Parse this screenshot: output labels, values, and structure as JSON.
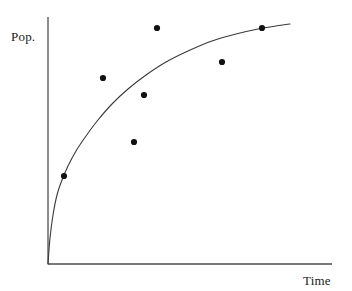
{
  "figure": {
    "background_color": "#ffffff",
    "axis_color": "#4d4d4d",
    "curve_color": "#3a3a3a",
    "point_color": "#111111",
    "width": 352,
    "height": 291
  },
  "labels": {
    "ylabel": "Pop.",
    "xlabel": "Time"
  },
  "chart_data": {
    "type": "scatter",
    "title": "",
    "subtitle": "",
    "xlabel": "Time",
    "ylabel": "Pop.",
    "grid": false,
    "legend": false,
    "legend_position": "none",
    "axis_style": "two-spine-open",
    "xlim": [
      0,
      1
    ],
    "ylim": [
      0,
      1
    ],
    "x_ticks": [],
    "y_ticks": [],
    "x_tick_labels": [],
    "y_tick_labels": [],
    "annotations": [],
    "series": [
      {
        "name": "Observations",
        "type": "scatter",
        "marker": "filled-circle",
        "marker_radius_px": 3.1,
        "color": "#111111",
        "points_px": [
          {
            "x": 64,
            "y": 176
          },
          {
            "x": 103,
            "y": 78
          },
          {
            "x": 134,
            "y": 142
          },
          {
            "x": 144,
            "y": 95
          },
          {
            "x": 157,
            "y": 28
          },
          {
            "x": 222,
            "y": 62
          },
          {
            "x": 262,
            "y": 28
          }
        ],
        "x": [
          0.056,
          0.194,
          0.303,
          0.338,
          0.384,
          0.613,
          0.754
        ],
        "y": [
          0.356,
          0.753,
          0.494,
          0.684,
          0.955,
          0.817,
          0.955
        ]
      }
    ],
    "fit_curve": {
      "name": "Fitted growth curve",
      "type": "line",
      "color": "#3a3a3a",
      "width_px": 1.1,
      "shape": "asymptotic-saturating",
      "start_px": {
        "x": 48,
        "y": 264
      },
      "end_px": {
        "x": 290,
        "y": 24
      },
      "path_px": [
        {
          "x": 48,
          "y": 264
        },
        {
          "x": 50,
          "y": 238
        },
        {
          "x": 53,
          "y": 215
        },
        {
          "x": 57,
          "y": 195
        },
        {
          "x": 62,
          "y": 180
        },
        {
          "x": 68,
          "y": 166
        },
        {
          "x": 76,
          "y": 151
        },
        {
          "x": 86,
          "y": 136
        },
        {
          "x": 98,
          "y": 120
        },
        {
          "x": 112,
          "y": 104
        },
        {
          "x": 128,
          "y": 89
        },
        {
          "x": 146,
          "y": 75
        },
        {
          "x": 166,
          "y": 62
        },
        {
          "x": 188,
          "y": 51
        },
        {
          "x": 212,
          "y": 41
        },
        {
          "x": 236,
          "y": 34
        },
        {
          "x": 258,
          "y": 29
        },
        {
          "x": 276,
          "y": 26
        },
        {
          "x": 290,
          "y": 24
        }
      ]
    },
    "axes_px": {
      "y_axis": {
        "x": 48,
        "y_top": 17,
        "y_bottom": 264
      },
      "x_axis": {
        "y": 264,
        "x_left": 48,
        "x_right": 332
      }
    }
  }
}
